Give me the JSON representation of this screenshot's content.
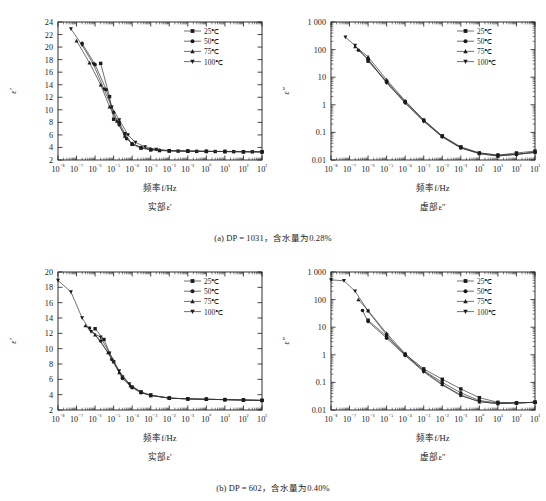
{
  "figure": {
    "captions": [
      "(a) DP = 1031，含水量为0.28%",
      "(b) DP = 602，含水量为0.40%"
    ]
  },
  "legend": {
    "entries": [
      {
        "label": "25℃",
        "marker": "square"
      },
      {
        "label": "50℃",
        "marker": "circle"
      },
      {
        "label": "75℃",
        "marker": "triangle-up"
      },
      {
        "label": "100℃",
        "marker": "triangle-down"
      }
    ]
  },
  "labels": {
    "xlabel": "频率f/Hz",
    "sub_real": "实部ε'",
    "sub_imag": "虚部ε″",
    "ylabel_real": "ε'",
    "ylabel_imag": "ε″"
  },
  "chart_data": [
    {
      "id": "panel-a-real",
      "type": "line",
      "title": "",
      "xlabel": "频率f/Hz",
      "ylabel": "ε'",
      "xscale": "log",
      "yscale": "linear",
      "xlim": [
        1e-08,
        1000
      ],
      "ylim": [
        2,
        24
      ],
      "xticks": [
        "10⁻⁸",
        "10⁻⁷",
        "10⁻⁶",
        "10⁻⁵",
        "10⁻⁴",
        "10⁻³",
        "10⁻²",
        "10⁻¹",
        "10⁰",
        "10¹",
        "10²",
        "10³"
      ],
      "yticks": [
        2,
        4,
        6,
        8,
        10,
        12,
        14,
        16,
        18,
        20,
        22,
        24
      ],
      "grid": false,
      "legend_position": "top-right",
      "series": [
        {
          "name": "25℃",
          "marker": "square",
          "x": [
            2e-06,
            6e-06,
            1e-05,
            2e-05,
            4e-05,
            0.0001,
            0.0003,
            0.001,
            0.003,
            0.01,
            0.03,
            0.1,
            0.3,
            1,
            3,
            10,
            30,
            100,
            300,
            1000
          ],
          "y": [
            17.4,
            12.1,
            8.5,
            8.0,
            6.2,
            4.5,
            3.9,
            3.6,
            3.5,
            3.45,
            3.42,
            3.4,
            3.38,
            3.36,
            3.35,
            3.34,
            3.33,
            3.32,
            3.31,
            3.3
          ]
        },
        {
          "name": "50℃",
          "marker": "circle",
          "x": [
            2e-07,
            1e-06,
            4e-06,
            1e-05,
            2e-05,
            5e-05,
            0.0001,
            0.0003,
            0.001,
            0.003,
            0.01,
            0.1,
            1,
            10,
            100,
            1000
          ],
          "y": [
            20.6,
            17.2,
            13.2,
            9.6,
            7.6,
            5.4,
            4.6,
            4.0,
            3.7,
            3.55,
            3.48,
            3.42,
            3.38,
            3.35,
            3.32,
            3.3
          ]
        },
        {
          "name": "75℃",
          "marker": "triangle-up",
          "x": [
            1e-07,
            5e-07,
            2e-06,
            6e-06,
            1.5e-05,
            4e-05,
            0.0001,
            0.0003,
            0.001,
            0.01,
            0.1,
            1,
            10,
            100,
            1000
          ],
          "y": [
            21.0,
            17.5,
            14.0,
            10.5,
            8.2,
            5.8,
            4.6,
            4.0,
            3.7,
            3.48,
            3.42,
            3.38,
            3.35,
            3.32,
            3.3
          ]
        },
        {
          "name": "100℃",
          "marker": "triangle-down",
          "x": [
            5e-08,
            2e-07,
            8e-07,
            3e-06,
            8e-06,
            2e-05,
            6e-05,
            0.00015,
            0.0005,
            0.002,
            0.01,
            0.1,
            1,
            10,
            100,
            1000
          ],
          "y": [
            22.9,
            20.3,
            17.3,
            13.3,
            10.4,
            8.4,
            6.0,
            4.8,
            4.1,
            3.7,
            3.5,
            3.42,
            3.38,
            3.35,
            3.32,
            3.3
          ]
        }
      ]
    },
    {
      "id": "panel-a-imag",
      "type": "line",
      "title": "",
      "xlabel": "频率f/Hz",
      "ylabel": "ε″",
      "xscale": "log",
      "yscale": "log",
      "xlim": [
        1e-08,
        1000
      ],
      "ylim": [
        0.01,
        1000
      ],
      "xticks": [
        "10⁻⁸",
        "10⁻⁷",
        "10⁻⁶",
        "10⁻⁵",
        "10⁻⁴",
        "10⁻³",
        "10⁻²",
        "10⁻¹",
        "10⁰",
        "10¹",
        "10²",
        "10³"
      ],
      "yticks": [
        "0.01",
        "0.1",
        "1",
        "10",
        "100",
        "1 000"
      ],
      "grid": false,
      "legend_position": "top-right",
      "series": [
        {
          "name": "25℃",
          "marker": "square",
          "x": [
            1e-06,
            1e-05,
            0.0001,
            0.001,
            0.01,
            0.1,
            1,
            10,
            100,
            1000
          ],
          "y": [
            38,
            7.0,
            1.3,
            0.28,
            0.075,
            0.03,
            0.018,
            0.015,
            0.018,
            0.021
          ]
        },
        {
          "name": "50℃",
          "marker": "circle",
          "x": [
            3e-07,
            1e-06,
            1e-05,
            0.0001,
            0.001,
            0.01,
            0.1,
            1,
            10,
            100,
            1000
          ],
          "y": [
            95,
            45,
            6.5,
            1.2,
            0.26,
            0.07,
            0.028,
            0.018,
            0.015,
            0.016,
            0.019
          ]
        },
        {
          "name": "75℃",
          "marker": "triangle-up",
          "x": [
            2e-07,
            1e-06,
            1e-05,
            0.0001,
            0.001,
            0.01,
            0.1,
            1,
            10,
            100,
            1000
          ],
          "y": [
            130,
            55,
            8.0,
            1.4,
            0.28,
            0.072,
            0.028,
            0.017,
            0.014,
            0.016,
            0.019
          ]
        },
        {
          "name": "100℃",
          "marker": "triangle-down",
          "x": [
            6e-08,
            2e-07,
            1e-06,
            1e-05,
            0.0001,
            0.001,
            0.01,
            0.1,
            1,
            10,
            100,
            1000
          ],
          "y": [
            280,
            140,
            42,
            6.2,
            1.15,
            0.25,
            0.068,
            0.027,
            0.017,
            0.014,
            0.016,
            0.019
          ]
        }
      ]
    },
    {
      "id": "panel-b-real",
      "type": "line",
      "title": "",
      "xlabel": "频率f/Hz",
      "ylabel": "ε'",
      "xscale": "log",
      "yscale": "linear",
      "xlim": [
        1e-08,
        1000
      ],
      "ylim": [
        2,
        20
      ],
      "xticks": [
        "10⁻⁸",
        "10⁻⁷",
        "10⁻⁶",
        "10⁻⁵",
        "10⁻⁴",
        "10⁻³",
        "10⁻²",
        "10⁻¹",
        "10⁰",
        "10¹",
        "10²",
        "10³"
      ],
      "yticks": [
        2,
        4,
        6,
        8,
        10,
        12,
        14,
        16,
        18,
        20
      ],
      "grid": false,
      "legend_position": "top-right",
      "series": [
        {
          "name": "25℃",
          "marker": "square",
          "x": [
            1e-06,
            3e-06,
            1e-05,
            3e-05,
            0.0001,
            0.0003,
            0.001,
            0.01,
            0.1,
            1,
            10,
            100,
            1000
          ],
          "y": [
            12.6,
            11.2,
            8.3,
            6.3,
            5.0,
            4.3,
            3.9,
            3.55,
            3.45,
            3.4,
            3.35,
            3.3,
            3.25
          ]
        },
        {
          "name": "50℃",
          "marker": "circle",
          "x": [
            5e-07,
            2e-06,
            8e-06,
            3e-05,
            0.0001,
            0.0003,
            0.001,
            0.01,
            0.1,
            1,
            10,
            100,
            1000
          ],
          "y": [
            12.7,
            11.0,
            8.6,
            6.1,
            4.9,
            4.25,
            3.9,
            3.55,
            3.45,
            3.4,
            3.35,
            3.3,
            3.25
          ]
        },
        {
          "name": "75℃",
          "marker": "triangle-up",
          "x": [
            3e-07,
            1e-06,
            5e-06,
            2e-05,
            8e-05,
            0.0003,
            0.001,
            0.01,
            0.1,
            1,
            10,
            100,
            1000
          ],
          "y": [
            13.0,
            11.8,
            9.5,
            6.9,
            5.2,
            4.3,
            3.9,
            3.55,
            3.45,
            3.4,
            3.35,
            3.3,
            3.25
          ]
        },
        {
          "name": "100℃",
          "marker": "triangle-down",
          "x": [
            1e-08,
            5e-08,
            2e-07,
            6e-07,
            2e-06,
            6e-06,
            2e-05,
            7e-05,
            0.0003,
            0.001,
            0.01,
            0.1,
            1,
            10,
            100,
            1000
          ],
          "y": [
            18.9,
            17.4,
            14.0,
            12.2,
            11.5,
            9.4,
            7.1,
            5.4,
            4.35,
            3.95,
            3.55,
            3.45,
            3.4,
            3.35,
            3.3,
            3.25
          ]
        }
      ]
    },
    {
      "id": "panel-b-imag",
      "type": "line",
      "title": "",
      "xlabel": "频率f/Hz",
      "ylabel": "ε″",
      "xscale": "log",
      "yscale": "log",
      "xlim": [
        1e-08,
        1000
      ],
      "ylim": [
        0.01,
        1000
      ],
      "xticks": [
        "10⁻⁸",
        "10⁻⁷",
        "10⁻⁶",
        "10⁻⁵",
        "10⁻⁴",
        "10⁻³",
        "10⁻²",
        "10⁻¹",
        "10⁰",
        "10¹",
        "10²",
        "10³"
      ],
      "yticks": [
        "0.01",
        "0.1",
        "1",
        "10",
        "100",
        "1 000"
      ],
      "grid": false,
      "legend_position": "top-right",
      "series": [
        {
          "name": "25℃",
          "marker": "square",
          "x": [
            1e-06,
            1e-05,
            0.0001,
            0.001,
            0.01,
            0.1,
            1,
            10,
            100,
            1000
          ],
          "y": [
            18,
            4.6,
            1.05,
            0.31,
            0.13,
            0.058,
            0.028,
            0.019,
            0.018,
            0.019
          ]
        },
        {
          "name": "50℃",
          "marker": "circle",
          "x": [
            5e-07,
            1e-06,
            1e-05,
            0.0001,
            0.001,
            0.01,
            0.1,
            1,
            10,
            100,
            1000
          ],
          "y": [
            40,
            16,
            4.0,
            0.95,
            0.27,
            0.1,
            0.042,
            0.022,
            0.018,
            0.018,
            0.019
          ]
        },
        {
          "name": "75℃",
          "marker": "triangle-up",
          "x": [
            3e-07,
            1e-06,
            1e-05,
            0.0001,
            0.001,
            0.01,
            0.1,
            1,
            10,
            100,
            1000
          ],
          "y": [
            100,
            40,
            6.0,
            1.1,
            0.26,
            0.085,
            0.035,
            0.02,
            0.017,
            0.018,
            0.019
          ]
        },
        {
          "name": "100℃",
          "marker": "triangle-down",
          "x": [
            1e-08,
            5e-08,
            2e-07,
            1e-06,
            1e-05,
            0.0001,
            0.001,
            0.01,
            0.1,
            1,
            10,
            100,
            1000
          ],
          "y": [
            520,
            480,
            200,
            38,
            5.2,
            0.95,
            0.24,
            0.08,
            0.033,
            0.02,
            0.017,
            0.018,
            0.019
          ]
        }
      ]
    }
  ]
}
